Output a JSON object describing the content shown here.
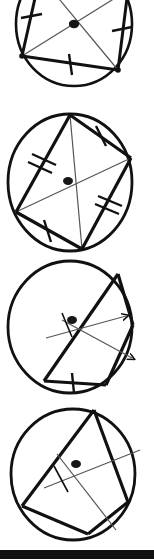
{
  "page": {
    "width": 154,
    "height": 560,
    "background_color": "#ffffff",
    "ink_color": "#111111",
    "thin_ink_color": "#555555"
  },
  "figures": [
    {
      "id": "figure-1",
      "index": 1,
      "y": -22,
      "height": 132,
      "center_label": "O",
      "center": {
        "x": 74,
        "y": 46
      },
      "circle": {
        "cx": 74,
        "cy": 46,
        "rx": 58,
        "ry": 62
      },
      "vertices": [
        {
          "name": "A",
          "x": 22,
          "y": 78
        },
        {
          "name": "B",
          "x": 118,
          "y": 92
        },
        {
          "name": "C",
          "x": 128,
          "y": 12
        },
        {
          "name": "D",
          "x": 40,
          "y": -2
        }
      ],
      "chords": [
        {
          "from": "A",
          "to": "B",
          "ticks": 1
        },
        {
          "from": "B",
          "to": "C",
          "ticks": 1
        },
        {
          "from": "D",
          "to": "A",
          "ticks": 1
        },
        {
          "from": "A",
          "to": "C",
          "ticks": 0
        },
        {
          "from": "B",
          "to": "D",
          "ticks": 0
        }
      ],
      "tick_marks": 3,
      "tick_style": "single"
    },
    {
      "id": "figure-2",
      "index": 2,
      "y": 112,
      "height": 144,
      "center_label": "O",
      "center": {
        "x": 68,
        "y": 69
      },
      "circle": {
        "cx": 70,
        "cy": 70,
        "rx": 62,
        "ry": 68
      },
      "vertices": [
        {
          "name": "A",
          "x": 70,
          "y": 3
        },
        {
          "name": "B",
          "x": 131,
          "y": 46
        },
        {
          "name": "C",
          "x": 82,
          "y": 137
        },
        {
          "name": "D",
          "x": 16,
          "y": 100
        }
      ],
      "chords": [
        {
          "from": "A",
          "to": "B",
          "ticks": 1
        },
        {
          "from": "B",
          "to": "C",
          "ticks": 2
        },
        {
          "from": "C",
          "to": "D",
          "ticks": 1
        },
        {
          "from": "D",
          "to": "A",
          "ticks": 2
        },
        {
          "from": "A",
          "to": "C",
          "ticks": 0
        },
        {
          "from": "B",
          "to": "D",
          "ticks": 0
        }
      ],
      "tick_marks": 6,
      "tick_style": "single-and-double"
    },
    {
      "id": "figure-3",
      "index": 3,
      "y": 257,
      "height": 144,
      "center_label": "O",
      "center": {
        "x": 72,
        "y": 63
      },
      "circle": {
        "cx": 70,
        "cy": 70,
        "rx": 62,
        "ry": 66
      },
      "vertices": [
        {
          "name": "A",
          "x": 118,
          "y": 17
        },
        {
          "name": "B",
          "x": 133,
          "y": 68
        },
        {
          "name": "C",
          "x": 106,
          "y": 128
        },
        {
          "name": "D",
          "x": 44,
          "y": 124
        }
      ],
      "chords": [
        {
          "from": "A",
          "to": "B",
          "arrows": 1
        },
        {
          "from": "B",
          "to": "C",
          "arrows": 0
        },
        {
          "from": "C",
          "to": "D",
          "ticks": 1
        },
        {
          "from": "D",
          "to": "A",
          "arrows": 0
        }
      ],
      "arrow_marks": 2,
      "tick_marks": 2,
      "tick_style": "single-with-arrows"
    },
    {
      "id": "figure-4",
      "index": 4,
      "y": 402,
      "height": 148,
      "center_label": "O",
      "center": {
        "x": 76,
        "y": 62
      },
      "circle": {
        "cx": 73,
        "cy": 72,
        "rx": 62,
        "ry": 66
      },
      "vertices": [
        {
          "name": "A",
          "x": 94,
          "y": 8
        },
        {
          "name": "B",
          "x": 128,
          "y": 100
        },
        {
          "name": "C",
          "x": 88,
          "y": 132
        },
        {
          "name": "D",
          "x": 22,
          "y": 104
        }
      ],
      "chords": [
        {
          "from": "A",
          "to": "B",
          "ticks": 0
        },
        {
          "from": "B",
          "to": "C",
          "ticks": 0
        },
        {
          "from": "C",
          "to": "D",
          "ticks": 0
        },
        {
          "from": "D",
          "to": "A",
          "ticks": 0
        }
      ],
      "tick_marks": 1,
      "tick_style": "perpendicular-cross"
    }
  ],
  "bottom_bar": {
    "y": 550,
    "height": 9,
    "color": "#111111"
  }
}
